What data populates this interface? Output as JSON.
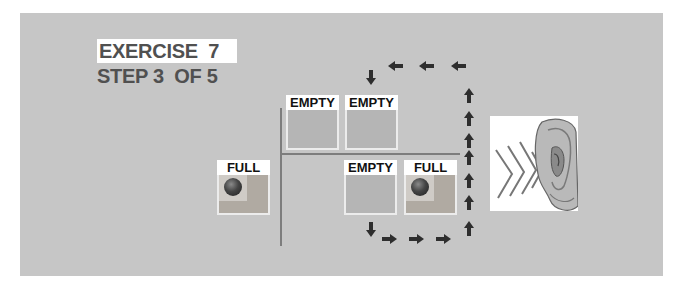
{
  "header": {
    "exercise_label": "EXERCISE  7",
    "step_label": "STEP 3  OF 5"
  },
  "slots": {
    "top_left": {
      "label": "EMPTY",
      "state": "empty"
    },
    "top_right": {
      "label": "EMPTY",
      "state": "empty"
    },
    "left": {
      "label": "FULL",
      "state": "full"
    },
    "bottom_left": {
      "label": "EMPTY",
      "state": "empty"
    },
    "bottom_right": {
      "label": "FULL",
      "state": "full"
    }
  },
  "flow_arrows": {
    "bottom_down": "down-arrow-icon",
    "bottom_right": [
      "right-arrow-icon",
      "right-arrow-icon",
      "right-arrow-icon"
    ],
    "right_up": [
      "up-arrow-icon",
      "up-arrow-icon",
      "up-arrow-icon",
      "up-arrow-icon",
      "up-arrow-icon",
      "up-arrow-icon"
    ],
    "top_left": [
      "left-arrow-icon",
      "left-arrow-icon",
      "left-arrow-icon"
    ],
    "top_down": "down-arrow-icon"
  },
  "image": {
    "icon": "ear-listening-icon"
  },
  "colors": {
    "panel": "#c6c6c6",
    "text": "#505050",
    "arrow": "#2e2e2e"
  }
}
